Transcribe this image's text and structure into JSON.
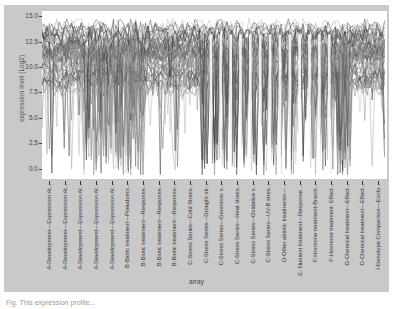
{
  "chart_data": {
    "type": "line",
    "title": "",
    "xlabel": "array",
    "ylabel": "expression level (Log2)",
    "ylim": [
      -1.0,
      15.5
    ],
    "yticks": [
      "0.0",
      "2.5",
      "5.0",
      "7.5",
      "10.0",
      "12.5",
      "15.0"
    ],
    "grid": false,
    "legend": null,
    "categories": [
      "A-Development---Expression At...",
      "A-Development---Expression At...",
      "A-Development---Expression At...",
      "A-Development---Expression At...",
      "A-Development---Expression At...",
      "B-Biotic treatment---Pseudomo...",
      "B-Biotic treatment---Response...",
      "B-Biotic treatment---Response...",
      "B-Biotic treatment---Response...",
      "C-Stress Series---Cold Stress...",
      "C-Stress Series---Drought str...",
      "C-Stress Series---Genotoxic s...",
      "C-Stress Series---Heat stress...",
      "C-Stress Series---Oxidative s...",
      "C-Stress Series---UV-B stres...",
      "D-Other abiotic treatments---...",
      "E- Nutrient treatment---Response ...",
      "F-Hormone treatment-Brasin...",
      "F-Hormone treatment: Effect...",
      "G-Chemical treatment---Effect...",
      "G-Chemical treatment---Effect...",
      "I-Genotype Comparison---Ecoty..."
    ],
    "series_summary": {
      "description": "Many overlaid gene expression profiles (grayscale) across arrays",
      "upper_envelope_approx": 14.8,
      "typical_band": [
        7.5,
        14.0
      ],
      "lower_envelope_min_approx": -0.5
    }
  },
  "caption": "Fig. This expression profile..."
}
